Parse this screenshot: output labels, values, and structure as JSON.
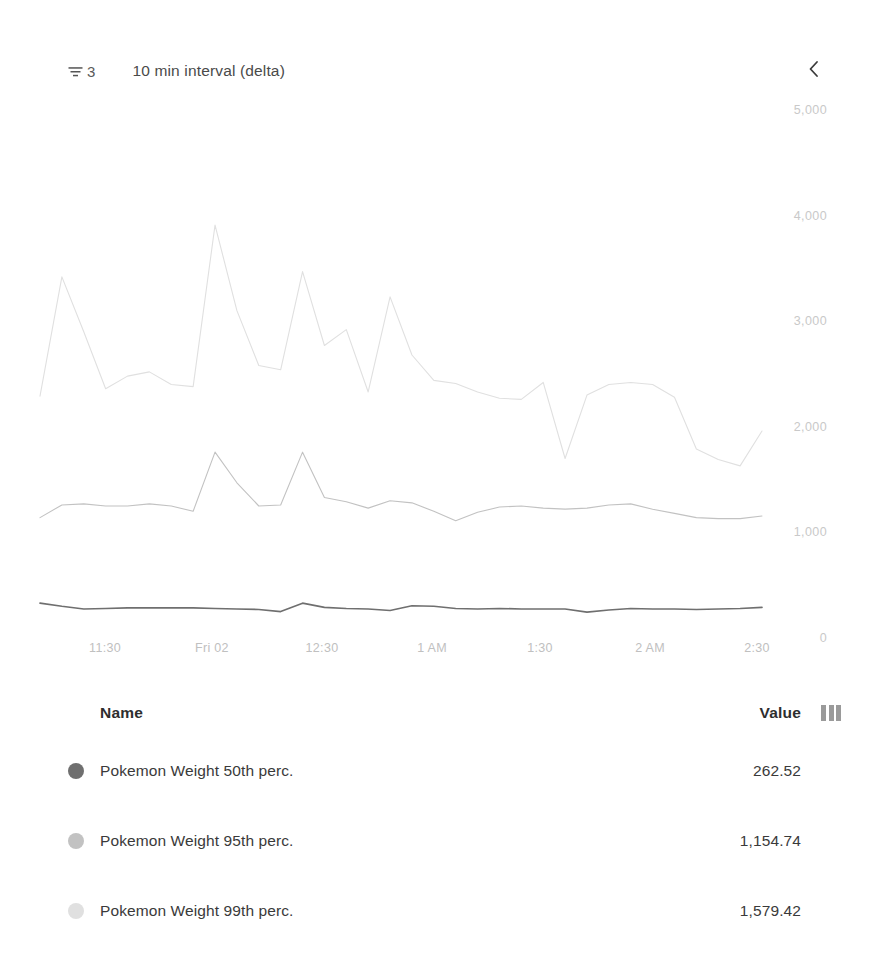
{
  "header": {
    "filter_icon": "funnel-icon",
    "filter_count": "3",
    "interval_label": "10 min interval (delta)",
    "collapse_icon": "chevron-left-icon"
  },
  "legend": {
    "columns_icon": "columns-icon",
    "headers": {
      "name": "Name",
      "value": "Value"
    },
    "rows": [
      {
        "name": "Pokemon Weight 50th perc.",
        "value": "262.52",
        "color": "#6f6f6f"
      },
      {
        "name": "Pokemon Weight 95th perc.",
        "value": "1,154.74",
        "color": "#c2c2c2"
      },
      {
        "name": "Pokemon Weight 99th perc.",
        "value": "1,579.42",
        "color": "#e0e0e0"
      }
    ]
  },
  "chart_data": {
    "type": "line",
    "title": "",
    "xlabel": "",
    "ylabel": "",
    "ylim": [
      0,
      5000
    ],
    "yticks": [
      0,
      1000,
      2000,
      3000,
      4000,
      5000
    ],
    "ytick_labels": [
      "0",
      "1,000",
      "2,000",
      "3,000",
      "4,000",
      "5,000"
    ],
    "xtick_labels": [
      "11:30",
      "Fri 02",
      "12:30",
      "1 AM",
      "1:30",
      "2 AM",
      "2:30"
    ],
    "xtick_positions": [
      105,
      212,
      322,
      432,
      540,
      650,
      757
    ],
    "grid": false,
    "legend_position": "bottom-table",
    "plot_box": {
      "left": 40,
      "right": 762,
      "top": 110,
      "bottom": 638
    },
    "x": [
      0,
      1,
      2,
      3,
      4,
      5,
      6,
      7,
      8,
      9,
      10,
      11,
      12,
      13,
      14,
      15,
      16,
      17,
      18,
      19,
      20,
      21,
      22,
      23,
      24,
      25,
      26,
      27,
      28,
      29,
      30,
      31,
      32,
      33
    ],
    "series": [
      {
        "name": "Pokemon Weight 99th perc.",
        "color": "#e0e0e0",
        "values": [
          2290,
          3420,
          2900,
          2360,
          2480,
          2520,
          2400,
          2380,
          3910,
          3100,
          2580,
          2540,
          3470,
          2770,
          2920,
          2330,
          3230,
          2680,
          2440,
          2410,
          2330,
          2270,
          2260,
          2420,
          1700,
          2300,
          2400,
          2420,
          2400,
          2280,
          1790,
          1690,
          1630,
          1960
        ]
      },
      {
        "name": "Pokemon Weight 95th perc.",
        "color": "#c2c2c2",
        "values": [
          1140,
          1260,
          1270,
          1250,
          1250,
          1270,
          1250,
          1200,
          1760,
          1470,
          1250,
          1260,
          1760,
          1330,
          1290,
          1230,
          1300,
          1280,
          1200,
          1110,
          1190,
          1240,
          1250,
          1230,
          1220,
          1230,
          1260,
          1270,
          1220,
          1180,
          1140,
          1130,
          1130,
          1155
        ]
      },
      {
        "name": "Pokemon Weight 50th perc.",
        "color": "#6f6f6f",
        "values": [
          330,
          300,
          275,
          280,
          285,
          285,
          285,
          285,
          280,
          275,
          270,
          250,
          330,
          290,
          280,
          275,
          260,
          305,
          300,
          280,
          275,
          280,
          275,
          275,
          275,
          245,
          265,
          280,
          275,
          275,
          270,
          275,
          280,
          290
        ]
      }
    ]
  }
}
